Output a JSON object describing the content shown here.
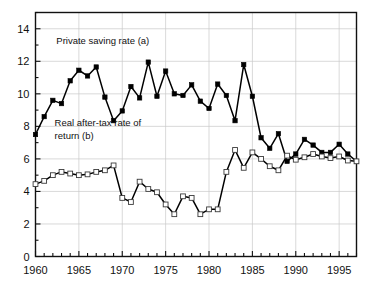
{
  "chart_data": {
    "type": "line",
    "title": "",
    "xlabel": "",
    "ylabel": "",
    "xlim": [
      1960,
      1997
    ],
    "ylim": [
      0,
      15
    ],
    "grid": true,
    "legend_position": "inline-annotation",
    "x_tick_labels": [
      "1960",
      "1965",
      "1970",
      "1975",
      "1980",
      "1985",
      "1990",
      "1995"
    ],
    "x_tick_values": [
      1960,
      1965,
      1970,
      1975,
      1980,
      1985,
      1990,
      1995
    ],
    "x_minor_tick_step": 1,
    "y_tick_labels": [
      "0",
      "2",
      "4",
      "6",
      "8",
      "10",
      "12",
      "14"
    ],
    "y_tick_values": [
      0,
      2,
      4,
      6,
      8,
      10,
      12,
      14
    ],
    "y_minor_tick_step": 1,
    "x": [
      1960,
      1961,
      1962,
      1963,
      1964,
      1965,
      1966,
      1967,
      1968,
      1969,
      1970,
      1971,
      1972,
      1973,
      1974,
      1975,
      1976,
      1977,
      1978,
      1979,
      1980,
      1981,
      1982,
      1983,
      1984,
      1985,
      1986,
      1987,
      1988,
      1989,
      1990,
      1991,
      1992,
      1993,
      1994,
      1995,
      1996,
      1997
    ],
    "series": [
      {
        "name": "Private saving rate (a)",
        "marker": "filled-square",
        "color": "#000000",
        "annotation": "Private saving rate (a)",
        "values": [
          7.5,
          8.6,
          9.6,
          9.4,
          10.8,
          11.45,
          11.1,
          11.65,
          9.8,
          8.35,
          8.95,
          10.45,
          9.75,
          11.95,
          9.85,
          11.4,
          10.0,
          9.9,
          10.55,
          9.55,
          9.1,
          10.6,
          9.9,
          8.35,
          11.8,
          9.85,
          7.3,
          6.65,
          7.55,
          5.85,
          6.3,
          7.2,
          6.85,
          6.4,
          6.4,
          6.9,
          6.3,
          5.85
        ]
      },
      {
        "name": "Real after-tax rate of return (b)",
        "marker": "open-square",
        "color": "#000000",
        "annotation": "Real after-tax rate of\nreturn (b)",
        "values": [
          4.45,
          4.65,
          5.0,
          5.2,
          5.1,
          5.0,
          5.05,
          5.2,
          5.3,
          5.6,
          3.6,
          3.35,
          4.6,
          4.15,
          3.95,
          3.2,
          2.6,
          3.7,
          3.6,
          2.6,
          2.9,
          2.9,
          5.2,
          6.55,
          5.45,
          6.4,
          6.0,
          5.55,
          5.3,
          6.2,
          5.95,
          6.1,
          6.3,
          6.15,
          6.05,
          6.15,
          5.9,
          5.85
        ]
      }
    ],
    "annotations": [
      {
        "text": "Private saving rate (a)",
        "x": 1962.4,
        "y": 13.05
      },
      {
        "text": "Real after-tax rate of",
        "x": 1962.2,
        "y": 8.05
      },
      {
        "text": "return (b)",
        "x": 1962.2,
        "y": 7.25
      }
    ]
  },
  "figure": {
    "background_color": "#ffffff",
    "axis_color": "#111111",
    "grid_color": "#c8c8c8"
  }
}
